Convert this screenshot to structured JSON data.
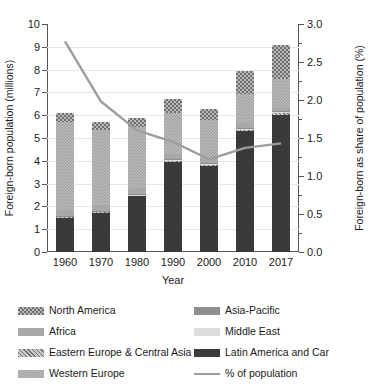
{
  "chart_data": {
    "type": "bar",
    "title": "",
    "subtitle": "",
    "xlabel": "Year",
    "ylabel": "Foreign-born population (millions)",
    "y2label": "Foreign-born as share of population (%)",
    "categories": [
      "1960",
      "1970",
      "1980",
      "1990",
      "2000",
      "2010",
      "2017"
    ],
    "ylim": [
      0,
      10
    ],
    "y2lim": [
      0.0,
      3.0
    ],
    "yticks": [
      "0",
      "1",
      "2",
      "3",
      "4",
      "5",
      "6",
      "7",
      "8",
      "9",
      "10"
    ],
    "y2ticks": [
      "0.0",
      "0.5",
      "1.0",
      "1.5",
      "2.0",
      "2.5",
      "3.0"
    ],
    "grid": true,
    "legend_position": "below",
    "stacked": true,
    "series": [
      {
        "name": "Latin America and Car",
        "key": "latin-america",
        "pattern": "solid-dark",
        "color": "#3a3a3a",
        "values": [
          1.5,
          1.72,
          2.45,
          3.95,
          3.78,
          5.3,
          6.02
        ]
      },
      {
        "name": "Eastern Europe & Central Asia",
        "key": "eastern-europe",
        "pattern": "diagonal-hatch",
        "color": "#c9c9c9",
        "values": [
          0.04,
          0.04,
          0.04,
          0.04,
          0.05,
          0.06,
          0.07
        ]
      },
      {
        "name": "Middle East",
        "key": "middle-east",
        "pattern": "solid-light",
        "color": "#dcdcdc",
        "values": [
          0.02,
          0.02,
          0.02,
          0.03,
          0.04,
          0.04,
          0.05
        ]
      },
      {
        "name": "Asia-Pacific",
        "key": "asia-pacific",
        "pattern": "solid-mid",
        "color": "#8f8f8f",
        "values": [
          0.03,
          0.03,
          0.03,
          0.04,
          0.04,
          0.05,
          0.05
        ]
      },
      {
        "name": "Africa",
        "key": "africa",
        "pattern": "solid-gray",
        "color": "#a8a8a8",
        "values": [
          0.26,
          0.24,
          0.26,
          0.24,
          0.2,
          0.2,
          0.11
        ]
      },
      {
        "name": "Western Europe",
        "key": "western-europe",
        "pattern": "fine-check",
        "color": "#bdbdbd",
        "values": [
          3.85,
          3.3,
          2.7,
          1.8,
          1.7,
          1.3,
          1.3
        ]
      },
      {
        "name": "North America",
        "key": "north-america",
        "pattern": "coarse-check",
        "color": "#b9b9b9",
        "values": [
          0.4,
          0.35,
          0.4,
          0.6,
          0.45,
          1.0,
          1.5
        ]
      }
    ],
    "totals": [
      6.1,
      5.7,
      5.9,
      6.7,
      6.26,
      7.95,
      9.1
    ],
    "line_series": {
      "name": "% of population",
      "axis": "right",
      "color": "#9e9e9e",
      "values": [
        2.77,
        1.98,
        1.6,
        1.45,
        1.22,
        1.37,
        1.43
      ]
    }
  },
  "legend": {
    "left_column": [
      {
        "label": "North America",
        "swatch": "coarse-check"
      },
      {
        "label": "Africa",
        "swatch": "solid-gray"
      },
      {
        "label": "Eastern Europe & Central Asia",
        "swatch": "diagonal-hatch"
      },
      {
        "label": "Western Europe",
        "swatch": "fine-check"
      }
    ],
    "right_column": [
      {
        "label": "Asia-Pacific",
        "swatch": "solid-mid"
      },
      {
        "label": "Middle East",
        "swatch": "solid-light"
      },
      {
        "label": "Latin America and Car",
        "swatch": "solid-dark"
      },
      {
        "label": "% of population",
        "swatch": "line"
      }
    ]
  }
}
